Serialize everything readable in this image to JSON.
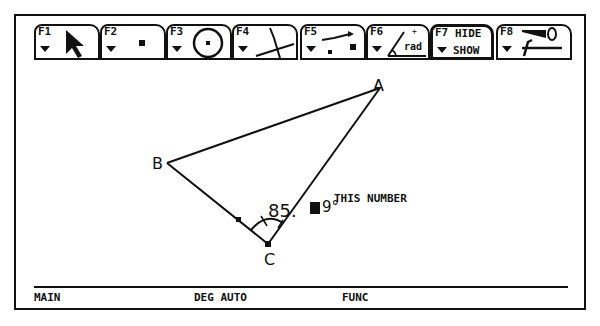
{
  "toolbar": {
    "tabs": [
      {
        "key": "F1",
        "icon": "pointer-arrow-icon"
      },
      {
        "key": "F2",
        "icon": "point-icon"
      },
      {
        "key": "F3",
        "icon": "circle-icon"
      },
      {
        "key": "F4",
        "icon": "lines-icon"
      },
      {
        "key": "F5",
        "icon": "construct-icon"
      },
      {
        "key": "F6",
        "icon": "angle-measure-icon",
        "icon_text": "rad"
      },
      {
        "key": "F7",
        "label_top": "HIDE",
        "label_bottom": "SHOW"
      },
      {
        "key": "F8",
        "icon": "edit-tools-icon"
      }
    ]
  },
  "drawing": {
    "points": [
      {
        "label": "A",
        "x": 380,
        "y": 88
      },
      {
        "label": "B",
        "x": 167,
        "y": 163
      },
      {
        "label": "C",
        "x": 268,
        "y": 244
      }
    ],
    "measurement": {
      "prefix": "85.",
      "suffix": "9°"
    },
    "annotation": "THIS NUMBER"
  },
  "statusbar": {
    "mode": "MAIN",
    "angle": "DEG AUTO",
    "graph": "FUNC"
  }
}
